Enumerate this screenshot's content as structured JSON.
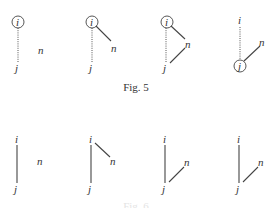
{
  "figures": [
    {
      "caption": "Fig. 5",
      "panels": [
        {
          "i": "i",
          "j": "j",
          "n": "n",
          "circled": "i",
          "i_j_edge": "dotted",
          "i_n_edge": "none",
          "j_n_edge": "none"
        },
        {
          "i": "i",
          "j": "j",
          "n": "n",
          "circled": "i",
          "i_j_edge": "dotted",
          "i_n_edge": "solid",
          "j_n_edge": "none"
        },
        {
          "i": "i",
          "j": "j",
          "n": "n",
          "circled": "i",
          "i_j_edge": "dotted",
          "i_n_edge": "solid",
          "j_n_edge": "solid"
        },
        {
          "i": "i",
          "j": "j",
          "n": "n",
          "circled": "j",
          "i_j_edge": "dotted",
          "i_n_edge": "none",
          "j_n_edge": "solid"
        }
      ]
    },
    {
      "caption": "Fig. 6",
      "panels": [
        {
          "i": "i",
          "j": "j",
          "n": "n",
          "circled": "none",
          "i_j_edge": "solid",
          "i_n_edge": "none",
          "j_n_edge": "none"
        },
        {
          "i": "i",
          "j": "j",
          "n": "n",
          "circled": "none",
          "i_j_edge": "solid",
          "i_n_edge": "solid",
          "j_n_edge": "none"
        },
        {
          "i": "i",
          "j": "j",
          "n": "n",
          "circled": "none",
          "i_j_edge": "solid",
          "i_n_edge": "none",
          "j_n_edge": "solid"
        },
        {
          "i": "i",
          "j": "j",
          "n": "n",
          "circled": "none",
          "i_j_edge": "solid",
          "i_n_edge": "none",
          "j_n_edge": "solid"
        }
      ]
    }
  ]
}
